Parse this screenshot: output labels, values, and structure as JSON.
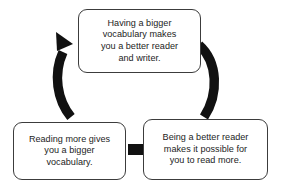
{
  "diagram": {
    "type": "cycle-diagram",
    "background_color": "#ffffff",
    "box_border_color": "#3c3c3c",
    "box_fill_color": "#ffffff",
    "arrow_color": "#111111",
    "text_color": "#1c1c1c",
    "nodes": [
      {
        "id": "top",
        "text": "Having a bigger\nvocabulary makes\nyou a better reader\nand writer."
      },
      {
        "id": "left",
        "text": "Reading more gives\nyou a bigger\nvocabulary."
      },
      {
        "id": "right",
        "text": "Being a better reader\nmakes it possible for\nyou to read more."
      }
    ],
    "connectors": [
      {
        "id": "left-arc",
        "from": "left",
        "to": "top",
        "style": "curved-thick",
        "arrowhead": "at-end"
      },
      {
        "id": "right-arc",
        "from": "top",
        "to": "right",
        "style": "curved-thick",
        "arrowhead": "none"
      },
      {
        "id": "bottom-link",
        "from": "right",
        "to": "left",
        "style": "straight-thick-short",
        "arrowhead": "none"
      }
    ]
  }
}
